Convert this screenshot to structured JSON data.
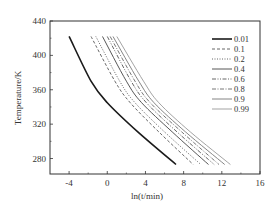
{
  "chart_data": {
    "type": "line",
    "title": "",
    "xlabel": "ln(t/min)",
    "ylabel": "Temperature/K",
    "xlim": [
      -6,
      16
    ],
    "ylim": [
      262,
      440
    ],
    "xticks": [
      -4,
      0,
      4,
      8,
      12,
      16
    ],
    "yticks": [
      280,
      320,
      360,
      400,
      440
    ],
    "grid": false,
    "legend_position": "upper right (inside)",
    "series": [
      {
        "name": "0.01",
        "style": "solid-thick",
        "color": "#1a1a1a",
        "x": [
          -4.0,
          -1.7,
          0.0,
          3.2,
          7.2
        ],
        "y": [
          422,
          370,
          345,
          311,
          273
        ]
      },
      {
        "name": "0.1",
        "style": "dash",
        "color": "#555555",
        "x": [
          -1.7,
          0.8,
          2.4,
          5.4,
          9.0
        ],
        "y": [
          422,
          370,
          345,
          311,
          273
        ]
      },
      {
        "name": "0.2",
        "style": "dot",
        "color": "#555555",
        "x": [
          -1.2,
          1.3,
          2.9,
          6.0,
          9.8
        ],
        "y": [
          422,
          370,
          345,
          311,
          273
        ]
      },
      {
        "name": "0.4",
        "style": "solid",
        "color": "#444444",
        "x": [
          -0.5,
          2.0,
          3.6,
          6.8,
          10.6
        ],
        "y": [
          422,
          370,
          345,
          311,
          273
        ]
      },
      {
        "name": "0.6",
        "style": "dash-dot-dot",
        "color": "#555555",
        "x": [
          0.0,
          2.5,
          4.1,
          7.3,
          11.2
        ],
        "y": [
          422,
          370,
          345,
          311,
          273
        ]
      },
      {
        "name": "0.8",
        "style": "dash-dot",
        "color": "#666666",
        "x": [
          0.3,
          2.9,
          4.5,
          7.8,
          11.7
        ],
        "y": [
          422,
          370,
          345,
          311,
          273
        ]
      },
      {
        "name": "0.9",
        "style": "solid",
        "color": "#777777",
        "x": [
          0.6,
          3.3,
          4.9,
          8.2,
          12.3
        ],
        "y": [
          422,
          370,
          345,
          311,
          273
        ]
      },
      {
        "name": "0.99",
        "style": "solid",
        "color": "#999999",
        "x": [
          1.0,
          3.8,
          5.4,
          8.7,
          12.9
        ],
        "y": [
          422,
          370,
          345,
          311,
          273
        ]
      }
    ]
  }
}
